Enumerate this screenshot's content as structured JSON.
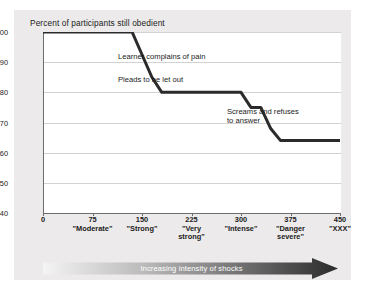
{
  "chart_data": {
    "type": "line",
    "title": "Percent of participants still obedient",
    "xlabel": "Increasing intensity of shocks",
    "ylabel": "",
    "xlim": [
      0,
      450
    ],
    "ylim": [
      40,
      100
    ],
    "grid": true,
    "legend": "none",
    "y_ticks": [
      100,
      90,
      80,
      70,
      60,
      50,
      40
    ],
    "x_ticks": [
      {
        "value": 0,
        "num": "0",
        "label": ""
      },
      {
        "value": 75,
        "num": "75",
        "label": "\"Moderate\""
      },
      {
        "value": 150,
        "num": "150",
        "label": "\"Strong\""
      },
      {
        "value": 225,
        "num": "225",
        "label": "\"Very\nstrong\""
      },
      {
        "value": 300,
        "num": "300",
        "label": "\"Intense\""
      },
      {
        "value": 375,
        "num": "375",
        "label": "\"Danger\nsevere\""
      },
      {
        "value": 450,
        "num": "450",
        "label": "\"XXX\""
      }
    ],
    "x": [
      0,
      135,
      165,
      180,
      300,
      315,
      330,
      345,
      360,
      450
    ],
    "values": [
      100,
      100,
      85,
      80,
      80,
      75,
      75,
      68,
      64,
      64
    ],
    "series": [
      {
        "name": "Percent still obedient",
        "points": [
          {
            "x": 0,
            "y": 100
          },
          {
            "x": 135,
            "y": 100
          },
          {
            "x": 165,
            "y": 85
          },
          {
            "x": 180,
            "y": 80
          },
          {
            "x": 300,
            "y": 80
          },
          {
            "x": 315,
            "y": 75
          },
          {
            "x": 330,
            "y": 75
          },
          {
            "x": 345,
            "y": 68
          },
          {
            "x": 360,
            "y": 64
          },
          {
            "x": 450,
            "y": 64
          }
        ]
      }
    ],
    "annotations": [
      {
        "text": "Learner complains of pain"
      },
      {
        "text": "Pleads to be let out"
      },
      {
        "text": "Screams and refuses\nto answer"
      }
    ],
    "colors": {
      "line": "#2b2b2b",
      "plot_background": "#ffffff",
      "figure_background": "#eceaea",
      "gridline": "#d2d2d2",
      "axis": "#6d6d6d",
      "arrow_start": "#f2f2f2",
      "arrow_end": "#2e2e2e",
      "text": "#1b1b1b"
    }
  }
}
